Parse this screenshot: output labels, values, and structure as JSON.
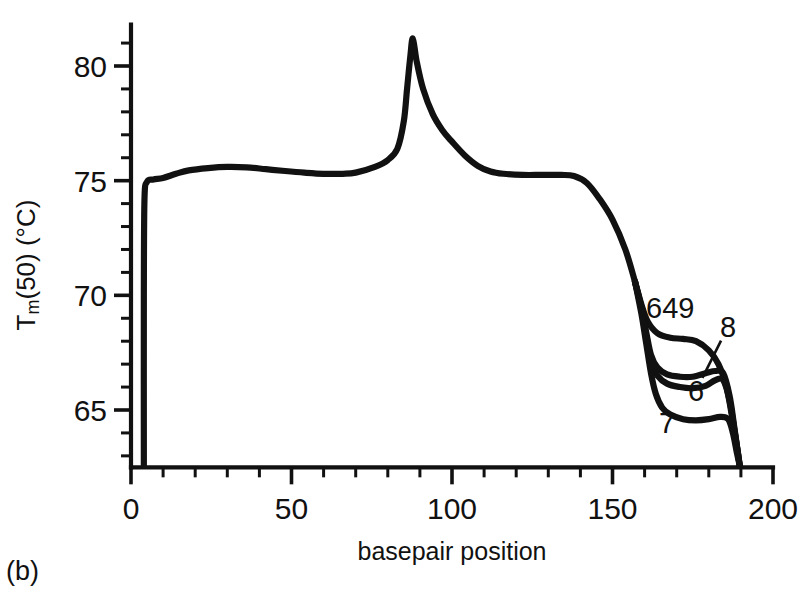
{
  "figure": {
    "panel_label": "(b)",
    "background_color": "#ffffff",
    "ink_color": "#111111"
  },
  "chart_data": {
    "type": "line",
    "title": "",
    "xlabel": "basepair position",
    "ylabel": "Tm(50) (°C)",
    "ylabel_parts": {
      "base": "T",
      "sub": "m",
      "rest": "(50) (°C)"
    },
    "xlim": [
      0,
      200
    ],
    "ylim": [
      62.5,
      81.8
    ],
    "grid": false,
    "legend_position": "inline-annotations",
    "x_major_ticks": [
      0,
      50,
      100,
      150,
      200
    ],
    "x_major_tick_labels": [
      "0",
      "50",
      "100",
      "150",
      "200"
    ],
    "x_minor_tick_step": 10,
    "y_major_ticks": [
      65,
      70,
      75,
      80
    ],
    "y_major_tick_labels": [
      "65",
      "70",
      "75",
      "80"
    ],
    "y_minor_tick_step": 1,
    "annotations": [
      {
        "label": "649",
        "x": 168,
        "y": 69.0
      },
      {
        "label": "8",
        "x": 186,
        "y": 68.2,
        "leader_to_x": 178,
        "leader_to_y": 66.4
      },
      {
        "label": "6",
        "x": 176,
        "y": 65.4
      },
      {
        "label": "7",
        "x": 167,
        "y": 64.0
      }
    ],
    "series": [
      {
        "name": "649",
        "label": "649",
        "points": [
          [
            4.0,
            62.6
          ],
          [
            4.0,
            70.0
          ],
          [
            4.2,
            74.2
          ],
          [
            5.0,
            74.95
          ],
          [
            7.0,
            75.05
          ],
          [
            10.0,
            75.12
          ],
          [
            14.0,
            75.3
          ],
          [
            18.0,
            75.45
          ],
          [
            24.0,
            75.55
          ],
          [
            30.0,
            75.6
          ],
          [
            36.0,
            75.58
          ],
          [
            42.0,
            75.5
          ],
          [
            48.0,
            75.42
          ],
          [
            54.0,
            75.35
          ],
          [
            60.0,
            75.3
          ],
          [
            66.0,
            75.3
          ],
          [
            70.0,
            75.35
          ],
          [
            76.0,
            75.6
          ],
          [
            80.0,
            75.9
          ],
          [
            83.0,
            76.4
          ],
          [
            85.0,
            77.6
          ],
          [
            86.0,
            79.0
          ],
          [
            87.0,
            80.4
          ],
          [
            87.8,
            81.2
          ],
          [
            89.0,
            80.2
          ],
          [
            91.0,
            79.0
          ],
          [
            94.0,
            77.9
          ],
          [
            97.0,
            77.2
          ],
          [
            100.0,
            76.7
          ],
          [
            104.0,
            76.1
          ],
          [
            108.0,
            75.65
          ],
          [
            112.0,
            75.4
          ],
          [
            116.0,
            75.3
          ],
          [
            122.0,
            75.25
          ],
          [
            128.0,
            75.25
          ],
          [
            134.0,
            75.25
          ],
          [
            138.0,
            75.2
          ],
          [
            142.0,
            74.9
          ],
          [
            146.0,
            74.2
          ],
          [
            150.0,
            73.3
          ],
          [
            154.0,
            72.0
          ],
          [
            157.0,
            70.6
          ],
          [
            159.0,
            69.6
          ],
          [
            161.0,
            68.85
          ],
          [
            164.0,
            68.35
          ],
          [
            168.0,
            68.15
          ],
          [
            172.0,
            68.1
          ],
          [
            176.0,
            68.0
          ],
          [
            180.0,
            67.6
          ],
          [
            183.0,
            67.0
          ],
          [
            185.5,
            66.0
          ],
          [
            187.5,
            64.5
          ],
          [
            189.0,
            63.2
          ],
          [
            189.6,
            62.6
          ]
        ]
      },
      {
        "name": "8",
        "label": "8",
        "points": [
          [
            157.0,
            70.6
          ],
          [
            159.0,
            69.5
          ],
          [
            160.5,
            68.4
          ],
          [
            162.0,
            67.4
          ],
          [
            164.0,
            66.85
          ],
          [
            167.0,
            66.55
          ],
          [
            171.0,
            66.45
          ],
          [
            175.0,
            66.45
          ],
          [
            179.0,
            66.6
          ],
          [
            182.0,
            66.7
          ],
          [
            184.5,
            66.6
          ],
          [
            186.5,
            65.6
          ],
          [
            188.0,
            64.2
          ],
          [
            189.2,
            63.0
          ],
          [
            189.6,
            62.6
          ]
        ]
      },
      {
        "name": "6",
        "label": "6",
        "points": [
          [
            157.0,
            70.6
          ],
          [
            159.0,
            69.4
          ],
          [
            160.5,
            68.2
          ],
          [
            162.0,
            67.1
          ],
          [
            164.0,
            66.5
          ],
          [
            167.0,
            66.15
          ],
          [
            171.0,
            66.0
          ],
          [
            175.0,
            65.95
          ],
          [
            179.0,
            66.05
          ],
          [
            182.0,
            66.3
          ],
          [
            184.5,
            66.3
          ],
          [
            186.5,
            65.4
          ],
          [
            188.0,
            64.1
          ],
          [
            189.2,
            63.0
          ],
          [
            189.6,
            62.6
          ]
        ]
      },
      {
        "name": "7",
        "label": "7",
        "points": [
          [
            157.0,
            70.6
          ],
          [
            159.0,
            69.2
          ],
          [
            160.5,
            67.9
          ],
          [
            162.0,
            66.6
          ],
          [
            163.5,
            65.7
          ],
          [
            165.5,
            65.1
          ],
          [
            168.0,
            64.8
          ],
          [
            172.0,
            64.6
          ],
          [
            176.0,
            64.55
          ],
          [
            180.0,
            64.6
          ],
          [
            183.5,
            64.7
          ],
          [
            186.0,
            64.6
          ],
          [
            187.5,
            64.0
          ],
          [
            188.8,
            63.1
          ],
          [
            189.6,
            62.6
          ]
        ]
      }
    ]
  }
}
